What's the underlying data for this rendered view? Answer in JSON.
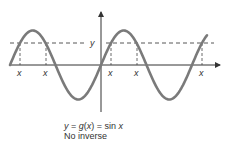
{
  "diagram": {
    "function_label": "y = g(x) = sin x",
    "function_parts": {
      "lhs": "y",
      "eq1": " = ",
      "g": "g",
      "paren_open": "(",
      "arg": "x",
      "paren_close": ")",
      "eq2": " = sin ",
      "x": "x"
    },
    "note": "No inverse",
    "horizontal_line_label": "y",
    "intersection_labels": [
      "x",
      "x",
      "x",
      "x",
      "x"
    ],
    "colors": {
      "curve": "#7a7a7a",
      "axis": "#333333",
      "dashed": "#444444",
      "text": "#333333"
    }
  }
}
